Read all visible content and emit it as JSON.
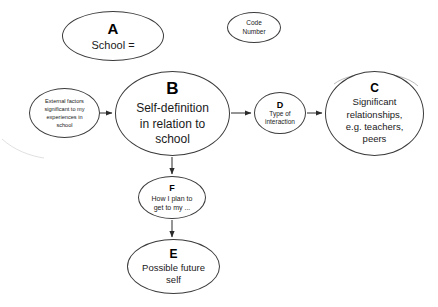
{
  "diagram": {
    "background_color": "#ffffff",
    "stroke_color": "#3b3b3b",
    "text_color": "#1a1a1a"
  },
  "nodes": {
    "a": {
      "tag": "A",
      "body": "School ="
    },
    "code": {
      "body": "Code\nNumber"
    },
    "external": {
      "body": "External factors\nsignificant to my\nexperiences in\nschool"
    },
    "b": {
      "tag": "B",
      "body": "Self-definition\nin relation to\nschool"
    },
    "d": {
      "tag": "D",
      "body": "Type of\ninteraction"
    },
    "c": {
      "tag": "C",
      "body": "Significant\nrelationships,\ne.g. teachers,\npeers"
    },
    "f": {
      "tag": "F",
      "body": "How I plan to\nget to my ..."
    },
    "e": {
      "tag": "E",
      "body": "Possible future\nself"
    }
  },
  "edges": [
    {
      "name": "external-to-b",
      "from": "external",
      "to": "b",
      "direction": "right"
    },
    {
      "name": "b-to-d",
      "from": "b",
      "to": "d",
      "direction": "right"
    },
    {
      "name": "d-to-c",
      "from": "d",
      "to": "c",
      "direction": "right"
    },
    {
      "name": "b-to-f",
      "from": "b",
      "to": "f",
      "direction": "down"
    },
    {
      "name": "f-to-e",
      "from": "f",
      "to": "e",
      "direction": "down"
    }
  ]
}
